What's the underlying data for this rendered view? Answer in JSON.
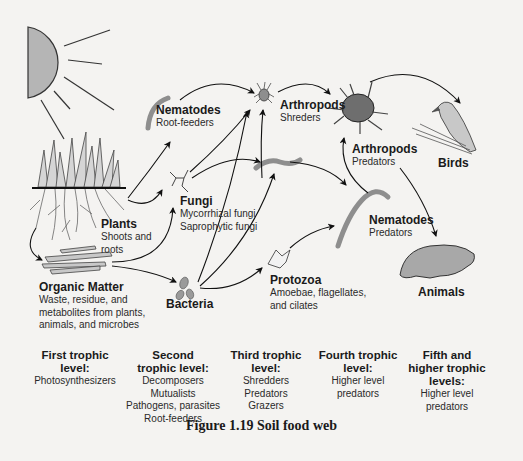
{
  "figure": {
    "caption": "Figure 1.19  Soil food web",
    "accent_gray": "#8e8e8e",
    "arrow_color": "#111111"
  },
  "nodes": {
    "plants": {
      "name": "Plants",
      "desc": [
        "Shoots and",
        "roots"
      ]
    },
    "organic_matter": {
      "name": "Organic Matter",
      "desc": [
        "Waste, residue, and",
        "metabolites from plants,",
        "animals, and microbes"
      ]
    },
    "nematodes_root": {
      "name": "Nematodes",
      "desc": [
        "Root-feeders"
      ]
    },
    "fungi": {
      "name": "Fungi",
      "desc": [
        "Mycorrhizal fungi",
        "Saprophytic fungi"
      ]
    },
    "bacteria": {
      "name": "Bacteria",
      "desc": []
    },
    "arthropods_shred": {
      "name": "Arthropods",
      "desc": [
        "Shreders"
      ]
    },
    "protozoa": {
      "name": "Protozoa",
      "desc": [
        "Amoebae, flagellates,",
        "and cilates"
      ]
    },
    "arthropods_pred": {
      "name": "Arthropods",
      "desc": [
        "Predators"
      ]
    },
    "nematodes_pred": {
      "name": "Nematodes",
      "desc": [
        "Predators"
      ]
    },
    "birds": {
      "name": "Birds",
      "desc": []
    },
    "animals": {
      "name": "Animals",
      "desc": []
    }
  },
  "trophic_levels": [
    {
      "heading": [
        "First trophic",
        "level:"
      ],
      "items": [
        "Photosynthesizers"
      ]
    },
    {
      "heading": [
        "Second",
        "trophic level:"
      ],
      "items": [
        "Decomposers",
        "Mutualists",
        "Pathogens, parasites",
        "Root-feeders"
      ]
    },
    {
      "heading": [
        "Third trophic",
        "level:"
      ],
      "items": [
        "Shredders",
        "Predators",
        "Grazers"
      ]
    },
    {
      "heading": [
        "Fourth trophic",
        "level:"
      ],
      "items": [
        "Higher level",
        "predators"
      ]
    },
    {
      "heading": [
        "Fifth and",
        "higher trophic",
        "levels:"
      ],
      "items": [
        "Higher level",
        "predators"
      ]
    }
  ],
  "icons": [
    "sun-icon",
    "grass-roots-icon",
    "litter-icon",
    "worm-icon",
    "fungi-hypha-icon",
    "bacteria-icon",
    "mite-icon",
    "protozoa-icon",
    "bird-icon",
    "rodent-icon"
  ]
}
